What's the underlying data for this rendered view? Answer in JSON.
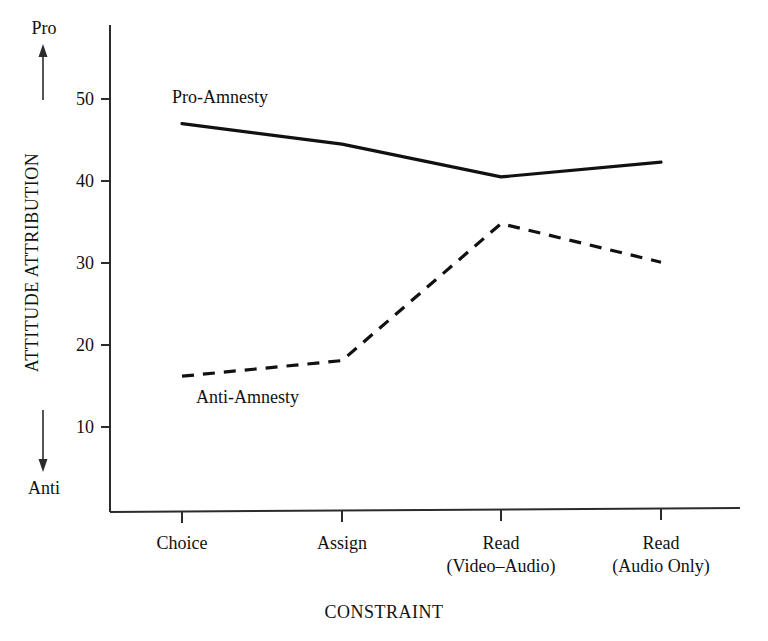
{
  "chart_data": {
    "type": "line",
    "title": "",
    "xlabel": "CONSTRAINT",
    "ylabel": "ATTITUDE ATTRIBUTION",
    "ylabel_high_pole": "Pro",
    "ylabel_low_pole": "Anti",
    "categories": [
      "Choice",
      "Assign",
      "Read\n(Video–Audio)",
      "Read\n(Audio Only)"
    ],
    "category_lines": [
      [
        "Choice"
      ],
      [
        "Assign"
      ],
      [
        "Read",
        "(Video–Audio)"
      ],
      [
        "Read",
        "(Audio Only)"
      ]
    ],
    "yticks": [
      10,
      20,
      30,
      40,
      50
    ],
    "ytick_labels": [
      "10",
      "20",
      "30",
      "40",
      "50"
    ],
    "ylim": [
      0,
      57
    ],
    "grid": false,
    "legend_position": "inline-annotation",
    "series": [
      {
        "name": "Pro-Amnesty",
        "style": "solid",
        "color": "#111111",
        "values": [
          47.0,
          44.5,
          40.5,
          42.3
        ]
      },
      {
        "name": "Anti-Amnesty",
        "style": "dashed",
        "color": "#111111",
        "values": [
          16.2,
          18.1,
          34.8,
          30.1
        ]
      }
    ],
    "annotations": [
      {
        "text": "Pro-Amnesty",
        "series": "Pro-Amnesty"
      },
      {
        "text": "Anti-Amnesty",
        "series": "Anti-Amnesty"
      }
    ]
  },
  "axes": {
    "y_pole_top": "Pro",
    "y_pole_bottom": "Anti",
    "y_axis_title": "ATTITUDE ATTRIBUTION",
    "x_axis_title": "CONSTRAINT"
  },
  "yticks": {
    "t50": "50",
    "t40": "40",
    "t30": "30",
    "t20": "20",
    "t10": "10"
  },
  "xticks": {
    "c1l1": "Choice",
    "c2l1": "Assign",
    "c3l1": "Read",
    "c3l2": "(Video–Audio)",
    "c4l1": "Read",
    "c4l2": "(Audio Only)"
  },
  "labels": {
    "pro_amnesty": "Pro-Amnesty",
    "anti_amnesty": "Anti-Amnesty"
  }
}
